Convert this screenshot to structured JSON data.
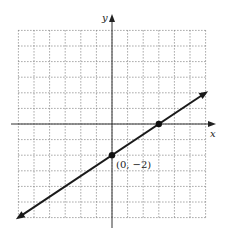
{
  "chart_data": {
    "type": "line",
    "title": "",
    "xlabel": "x",
    "ylabel": "y",
    "xlim": [
      -6,
      6
    ],
    "ylim": [
      -6,
      6
    ],
    "grid": true,
    "grid_style": "dotted",
    "tick_labels_shown": false,
    "series": [
      {
        "name": "line",
        "equation": "y = (2/3)x - 2",
        "slope": 0.6667,
        "intercept": -2,
        "x": [
          -6,
          6
        ],
        "y": [
          -6,
          2
        ],
        "arrows_both_ends": true,
        "color": "#1a1a1a"
      }
    ],
    "points": [
      {
        "x": 0,
        "y": -2,
        "label": "(0, −2)"
      },
      {
        "x": 3,
        "y": 0,
        "label": ""
      }
    ],
    "annotations": [
      {
        "text": "(0, −2)",
        "at": [
          0,
          -2
        ],
        "position": "below-right"
      }
    ]
  },
  "labels": {
    "x_axis": "x",
    "y_axis": "y",
    "point_a": "(0, −2)"
  }
}
